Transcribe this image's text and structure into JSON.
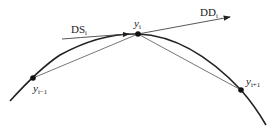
{
  "diagram": {
    "type": "curve-tangent-secant",
    "labels": {
      "ds": {
        "base": "DS",
        "sub": "i"
      },
      "dd": {
        "base": "DD",
        "sub": "i"
      },
      "y_prev": {
        "base": "y",
        "sub": "i−1"
      },
      "y_cur": {
        "base": "y",
        "sub": "i"
      },
      "y_next": {
        "base": "y",
        "sub": "i+1"
      }
    },
    "points": [
      {
        "name": "y_{i-1}",
        "x": 33,
        "y": 78
      },
      {
        "name": "y_i",
        "x": 138,
        "y": 34
      },
      {
        "name": "y_{i+1}",
        "x": 241,
        "y": 90
      }
    ],
    "colors": {
      "curve": "#222222",
      "secant": "#555555",
      "dot": "#111111"
    }
  }
}
